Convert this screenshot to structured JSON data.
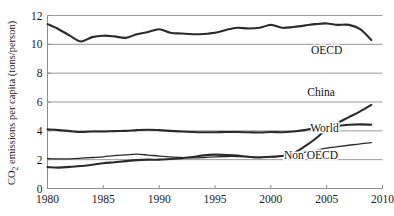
{
  "chart_data": {
    "type": "line",
    "title": "",
    "xlabel": "",
    "ylabel": "CO2 emissions per capita (tons/person)",
    "ylabel_prefix": "CO",
    "ylabel_subscript": "2",
    "ylabel_suffix": " emissions per capita (tons/person)",
    "xlim": [
      1980,
      2010
    ],
    "ylim": [
      0,
      12
    ],
    "grid": true,
    "grid_axis": "y",
    "legend_position": "inline-right",
    "x_ticks": [
      1980,
      1985,
      1990,
      1995,
      2000,
      2005,
      2010
    ],
    "x_tick_labels": [
      "1980",
      "1985",
      "1990",
      "1995",
      "2000",
      "2005",
      "2010"
    ],
    "y_ticks": [
      0,
      2,
      4,
      6,
      8,
      10,
      12
    ],
    "y_tick_labels": [
      "0",
      "2",
      "4",
      "6",
      "8",
      "10",
      "12"
    ],
    "x": [
      1980,
      1981,
      1982,
      1983,
      1984,
      1985,
      1986,
      1987,
      1988,
      1989,
      1990,
      1991,
      1992,
      1993,
      1994,
      1995,
      1996,
      1997,
      1998,
      1999,
      2000,
      2001,
      2002,
      2003,
      2004,
      2005,
      2006,
      2007,
      2008,
      2009
    ],
    "series": [
      {
        "name": "OECD",
        "label": "OECD",
        "color": "#2b2b2b",
        "label_x": 2005.0,
        "label_y": 9.35,
        "values": [
          11.4,
          11.05,
          10.6,
          10.2,
          10.5,
          10.6,
          10.55,
          10.45,
          10.7,
          10.85,
          11.05,
          10.8,
          10.75,
          10.7,
          10.72,
          10.8,
          11.0,
          11.15,
          11.1,
          11.15,
          11.35,
          11.15,
          11.2,
          11.3,
          11.4,
          11.45,
          11.35,
          11.35,
          11.05,
          10.3
        ]
      },
      {
        "name": "China",
        "label": "China",
        "color": "#2b2b2b",
        "label_x": 2004.5,
        "label_y": 6.45,
        "values": [
          1.48,
          1.45,
          1.5,
          1.56,
          1.65,
          1.75,
          1.82,
          1.9,
          1.97,
          2.0,
          2.0,
          2.05,
          2.1,
          2.18,
          2.3,
          2.35,
          2.32,
          2.28,
          2.2,
          2.15,
          2.2,
          2.25,
          2.45,
          2.9,
          3.45,
          4.1,
          4.55,
          4.95,
          5.35,
          5.8
        ]
      },
      {
        "name": "World",
        "label": "World",
        "color": "#2b2b2b",
        "label_x": 2004.8,
        "label_y": 3.92,
        "values": [
          4.1,
          4.05,
          3.98,
          3.92,
          3.95,
          3.95,
          3.98,
          4.0,
          4.05,
          4.08,
          4.05,
          4.0,
          3.95,
          3.92,
          3.9,
          3.9,
          3.92,
          3.92,
          3.9,
          3.88,
          3.92,
          3.9,
          3.95,
          4.05,
          4.2,
          4.28,
          4.35,
          4.42,
          4.45,
          4.42
        ]
      },
      {
        "name": "Non OECD",
        "label": "Non OECD",
        "color": "#2b2b2b",
        "label_x": 2003.6,
        "label_y": 2.05,
        "values": [
          2.08,
          2.05,
          2.06,
          2.1,
          2.15,
          2.2,
          2.28,
          2.33,
          2.38,
          2.32,
          2.25,
          2.2,
          2.15,
          2.12,
          2.15,
          2.2,
          2.22,
          2.22,
          2.2,
          2.18,
          2.2,
          2.25,
          2.35,
          2.5,
          2.65,
          2.8,
          2.9,
          3.0,
          3.1,
          3.18
        ]
      }
    ]
  },
  "axes": {
    "y_axis_name": "y-axis",
    "x_axis_name": "x-axis"
  }
}
